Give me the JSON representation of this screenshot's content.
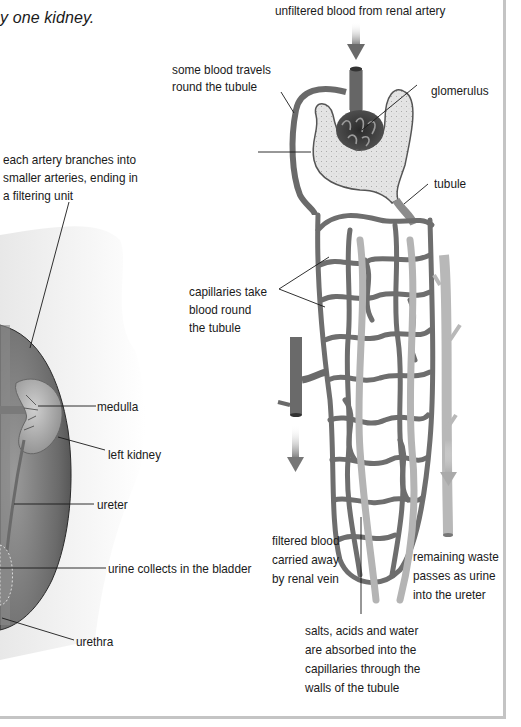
{
  "caption": "y one kidney.",
  "labels": {
    "renal_artery": "unfiltered blood from renal artery",
    "some_blood_1": "some blood travels",
    "some_blood_2": "round the tubule",
    "glomerulus": "glomerulus",
    "tubule": "tubule",
    "artery_branch_1": "each artery branches into",
    "artery_branch_2": "smaller arteries, ending in",
    "artery_branch_3": "a filtering unit",
    "capillaries_1": "capillaries take",
    "capillaries_2": "blood round",
    "capillaries_3": "the tubule",
    "medulla": "medulla",
    "left_kidney": "left kidney",
    "ureter": "ureter",
    "bladder": "urine collects in the bladder",
    "urethra": "urethra",
    "filtered_1": "filtered blood",
    "filtered_2": "carried away",
    "filtered_3": "by renal vein",
    "waste_1": "remaining waste",
    "waste_2": "passes as urine",
    "waste_3": "into the ureter",
    "absorbed_1": "salts, acids and water",
    "absorbed_2": "are absorbed into the",
    "absorbed_3": "capillaries through the",
    "absorbed_4": "walls of the tubule"
  },
  "colors": {
    "vessel": "#6f6f6f",
    "vessel_dark": "#3e3e3e",
    "tubule_fill": "#e6e6e6",
    "tubule_light": "#c8c8c8",
    "arrow": "#7a7a7a",
    "frame": "#c4c4c4"
  }
}
